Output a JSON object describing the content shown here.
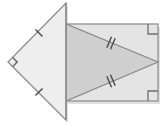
{
  "figure": {
    "canvas": {
      "width": 164,
      "height": 125,
      "background": "#ffffff"
    },
    "colors": {
      "left_triangle_fill": "#eeeeee",
      "rectangle_fill": "#e4e4e4",
      "inner_triangle_fill": "#cfcfcf",
      "stroke": "#8a8a8a",
      "mark_stroke": "#4a4a4a",
      "shadow": "#bdbdbd"
    },
    "shapes": [
      {
        "name": "left-right-triangle",
        "kind": "polygon",
        "points": "66,3 66,120 8,62",
        "fill": "#eeeeee",
        "stroke": "#8a8a8a",
        "stroke_width": 1.2
      },
      {
        "name": "rectangle",
        "kind": "rect",
        "x": 66,
        "y": 24,
        "width": 92,
        "height": 77,
        "fill": "#e4e4e4",
        "stroke": "#8a8a8a",
        "stroke_width": 1.2
      },
      {
        "name": "inner-isosceles-triangle",
        "kind": "polygon",
        "points": "66,24 66,101 158,62",
        "fill": "#cfcfcf",
        "stroke": "#8a8a8a",
        "stroke_width": 1.2
      }
    ],
    "marks": [
      {
        "name": "congruence-tick-upper-left-leg",
        "kind": "tick",
        "count": 1,
        "on_segment": "left-triangle-upper-leg",
        "x": 39,
        "y": 33,
        "angle": -45,
        "stroke": "#4a4a4a"
      },
      {
        "name": "congruence-tick-lower-left-leg",
        "kind": "tick",
        "count": 1,
        "on_segment": "left-triangle-lower-leg",
        "x": 39,
        "y": 92,
        "angle": 45,
        "stroke": "#4a4a4a"
      },
      {
        "name": "congruence-tick-upper-inner-side",
        "kind": "tick",
        "count": 2,
        "on_segment": "inner-triangle-upper-side",
        "x": 111,
        "y": 43,
        "angle": 23,
        "stroke": "#4a4a4a"
      },
      {
        "name": "congruence-tick-lower-inner-side",
        "kind": "tick",
        "count": 2,
        "on_segment": "inner-triangle-lower-side",
        "x": 111,
        "y": 81,
        "angle": -23,
        "stroke": "#4a4a4a"
      },
      {
        "name": "right-angle-mark-left-vertex",
        "kind": "right-angle-square",
        "vertex_x": 8,
        "vertex_y": 62,
        "size": 9,
        "rotation": 45,
        "stroke": "#6f6f6f"
      },
      {
        "name": "right-angle-mark-top-right-corner",
        "kind": "right-angle-square",
        "vertex_x": 158,
        "vertex_y": 24,
        "size": 10,
        "rotation": 0,
        "stroke": "#6f6f6f"
      },
      {
        "name": "right-angle-mark-bottom-right-corner",
        "kind": "right-angle-square",
        "vertex_x": 158,
        "vertex_y": 101,
        "size": 10,
        "rotation": 0,
        "stroke": "#6f6f6f"
      }
    ],
    "labels": []
  }
}
